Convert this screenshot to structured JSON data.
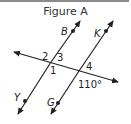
{
  "figure": {
    "title": "Figure A",
    "colors": {
      "line": "#222222",
      "topbar": "#8a8a8a",
      "text": "#333333"
    },
    "lines": {
      "line_BY": {
        "label_top": "B",
        "label_bottom": "Y"
      },
      "line_KG": {
        "label_top": "K",
        "label_bottom": "G"
      },
      "transversal": {}
    },
    "angles": {
      "angle1": "1",
      "angle2": "2",
      "angle3": "3",
      "angle4": "4",
      "given_angle": "110°"
    }
  }
}
